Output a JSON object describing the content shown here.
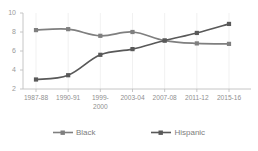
{
  "chart_data": {
    "type": "line",
    "title": "",
    "xlabel": "",
    "ylabel": "",
    "categories": [
      "1987-88",
      "1990-91",
      "1999-\n2000",
      "2003-04",
      "2007-08",
      "2011-12",
      "2015-16"
    ],
    "ylim": [
      2,
      10
    ],
    "yticks": [
      2,
      4,
      6,
      8,
      10
    ],
    "ytick_labels": [
      "2",
      "4",
      "6",
      "8",
      "10"
    ],
    "grid": "vertical",
    "legend_position": "bottom",
    "series": [
      {
        "name": "Black",
        "color": "#7f7f7f",
        "marker": "square",
        "values": [
          8.2,
          8.3,
          7.6,
          8.0,
          7.1,
          6.8,
          6.75
        ]
      },
      {
        "name": "Hispanic",
        "color": "#595959",
        "marker": "square",
        "values": [
          3.0,
          3.45,
          5.6,
          6.2,
          7.1,
          7.9,
          8.85
        ]
      }
    ]
  },
  "legend": {
    "items": [
      {
        "label": "Black"
      },
      {
        "label": "Hispanic"
      }
    ]
  }
}
